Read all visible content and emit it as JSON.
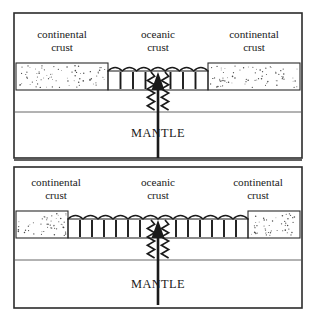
{
  "figure": {
    "title_visible": false,
    "width": 317,
    "height": 323,
    "background_color": "#ffffff",
    "ink_color": "#1a1a1a",
    "frame_color": "#2b2b2b"
  },
  "panels": [
    {
      "id": "panel-top",
      "stage": "early",
      "labels": {
        "left_crust_line1": "continental",
        "left_crust_line2": "crust",
        "center_crust_line1": "oceanic",
        "center_crust_line2": "crust",
        "right_crust_line1": "continental",
        "right_crust_line2": "crust",
        "mantle": "MANTLE"
      },
      "geometry": {
        "frame": {
          "x": 14,
          "y": 13,
          "w": 288,
          "h": 145
        },
        "crust_top_y": 63,
        "crust_bottom_y": 90,
        "ocean_floor_y": 71,
        "mantle_divider_y": 112,
        "left_continental": {
          "x": 16,
          "w": 92
        },
        "oceanic": {
          "x": 108,
          "w": 100
        },
        "right_continental": {
          "x": 208,
          "w": 92
        },
        "ridge_center_x": 158
      },
      "oceanic_tick_count": 8,
      "wave_count": 7,
      "label_positions": {
        "left_x": 62,
        "center_x": 158,
        "right_x": 254,
        "line1_y": 38,
        "line2_y": 51,
        "mantle_x": 158,
        "mantle_y": 137
      }
    },
    {
      "id": "panel-bottom",
      "stage": "later",
      "labels": {
        "left_crust_line1": "continental",
        "left_crust_line2": "crust",
        "center_crust_line1": "oceanic",
        "center_crust_line2": "crust",
        "right_crust_line1": "continental",
        "right_crust_line2": "crust",
        "mantle": "MANTLE"
      },
      "geometry": {
        "frame": {
          "x": 14,
          "y": 167,
          "w": 288,
          "h": 141
        },
        "crust_top_y": 211,
        "crust_bottom_y": 238,
        "ocean_floor_y": 219,
        "mantle_divider_y": 260,
        "left_continental": {
          "x": 16,
          "w": 52
        },
        "oceanic": {
          "x": 68,
          "w": 180
        },
        "right_continental": {
          "x": 248,
          "w": 52
        },
        "ridge_center_x": 158
      },
      "oceanic_tick_count": 15,
      "wave_count": 12,
      "label_positions": {
        "left_x": 56,
        "center_x": 158,
        "right_x": 258,
        "line1_y": 186,
        "line2_y": 199,
        "mantle_x": 158,
        "mantle_y": 288
      }
    }
  ],
  "divider": {
    "line_a_y": 160,
    "line_b_y": 167
  },
  "chart_data": {
    "type": "diagram",
    "stages": [
      {
        "name": "Stage 1 (top panel)",
        "oceanic_crust_width_px": 100,
        "continental_crust_width_px": 92,
        "ridge_center_px": 158,
        "notes": "Narrow young oceanic crust; continental blocks still close together"
      },
      {
        "name": "Stage 2 (bottom panel)",
        "oceanic_crust_width_px": 180,
        "continental_crust_width_px": 52,
        "ridge_center_px": 158,
        "notes": "Oceanic crust widened as continents drifted apart; mantle upwelling continues"
      }
    ],
    "legend": [
      "continental crust",
      "oceanic crust",
      "MANTLE"
    ]
  }
}
